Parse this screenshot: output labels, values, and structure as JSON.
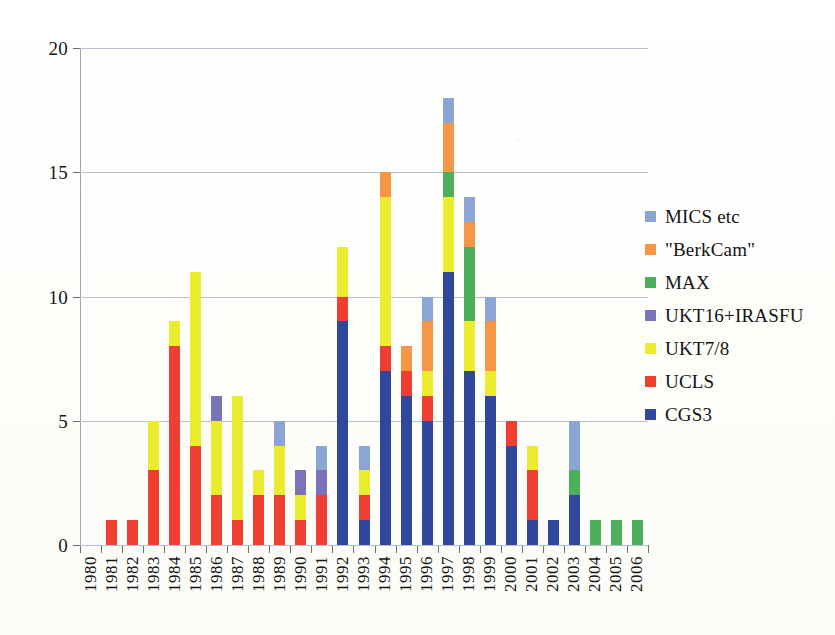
{
  "chart_data": {
    "type": "bar",
    "stacked": true,
    "title": "",
    "xlabel": "",
    "ylabel": "",
    "ylim": [
      0,
      20
    ],
    "yticks": [
      0,
      5,
      10,
      15,
      20
    ],
    "grid": true,
    "legend_position": "right",
    "categories": [
      "1980",
      "1981",
      "1982",
      "1983",
      "1984",
      "1985",
      "1986",
      "1987",
      "1988",
      "1989",
      "1990",
      "1991",
      "1992",
      "1993",
      "1994",
      "1995",
      "1996",
      "1997",
      "1998",
      "1999",
      "2000",
      "2001",
      "2002",
      "2003",
      "2004",
      "2005",
      "2006"
    ],
    "series": [
      {
        "name": "CGS3",
        "color": "#31479c",
        "values": [
          0,
          0,
          0,
          0,
          0,
          0,
          0,
          0,
          0,
          0,
          0,
          0,
          9,
          1,
          7,
          6,
          5,
          11,
          7,
          6,
          4,
          1,
          1,
          2,
          0,
          0,
          0
        ]
      },
      {
        "name": "UCLS",
        "color": "#ef3f32",
        "values": [
          0,
          1,
          1,
          3,
          8,
          4,
          2,
          1,
          2,
          2,
          1,
          2,
          1,
          1,
          1,
          1,
          1,
          0,
          0,
          0,
          1,
          2,
          0,
          0,
          0,
          0,
          0
        ]
      },
      {
        "name": "UKT7/8",
        "color": "#ecec2e",
        "values": [
          0,
          0,
          0,
          2,
          1,
          7,
          3,
          5,
          1,
          2,
          1,
          0,
          2,
          1,
          6,
          0,
          1,
          3,
          2,
          1,
          0,
          1,
          0,
          0,
          0,
          0,
          0
        ]
      },
      {
        "name": "UKT16+IRASFU",
        "color": "#7a73b8",
        "values": [
          0,
          0,
          0,
          0,
          0,
          0,
          1,
          0,
          0,
          0,
          1,
          1,
          0,
          0,
          0,
          0,
          0,
          0,
          0,
          0,
          0,
          0,
          0,
          0,
          0,
          0,
          0
        ]
      },
      {
        "name": "MAX",
        "color": "#4daf5a",
        "values": [
          0,
          0,
          0,
          0,
          0,
          0,
          0,
          0,
          0,
          0,
          0,
          0,
          0,
          0,
          0,
          0,
          0,
          1,
          3,
          0,
          0,
          0,
          0,
          1,
          1,
          1,
          1
        ]
      },
      {
        "name": "\"BerkCam\"",
        "color": "#f79646",
        "values": [
          0,
          0,
          0,
          0,
          0,
          0,
          0,
          0,
          0,
          0,
          0,
          0,
          0,
          0,
          1,
          1,
          2,
          2,
          1,
          2,
          0,
          0,
          0,
          0,
          0,
          0,
          0
        ]
      },
      {
        "name": "MICS etc",
        "color": "#8ba6d4",
        "values": [
          0,
          0,
          0,
          0,
          0,
          0,
          0,
          0,
          0,
          1,
          0,
          1,
          0,
          1,
          0,
          0,
          1,
          1,
          1,
          1,
          0,
          0,
          0,
          2,
          0,
          0,
          0
        ]
      }
    ],
    "totals": [
      0,
      1,
      1,
      5,
      9,
      11,
      6,
      6,
      3,
      5,
      3,
      4,
      12,
      4,
      15,
      8,
      10,
      17,
      14,
      10,
      5,
      4,
      1,
      5,
      1,
      1,
      1
    ],
    "legend_order": [
      "MICS etc",
      "\"BerkCam\"",
      "MAX",
      "UKT16+IRASFU",
      "UKT7/8",
      "UCLS",
      "CGS3"
    ]
  },
  "legend": {
    "entries": [
      {
        "label": "MICS etc",
        "color": "#8ba6d4"
      },
      {
        "label": "\"BerkCam\"",
        "color": "#f79646"
      },
      {
        "label": "MAX",
        "color": "#4daf5a"
      },
      {
        "label": "UKT16+IRASFU",
        "color": "#7a73b8"
      },
      {
        "label": "UKT7/8",
        "color": "#ecec2e"
      },
      {
        "label": "UCLS",
        "color": "#ef3f32"
      },
      {
        "label": "CGS3",
        "color": "#31479c"
      }
    ]
  }
}
